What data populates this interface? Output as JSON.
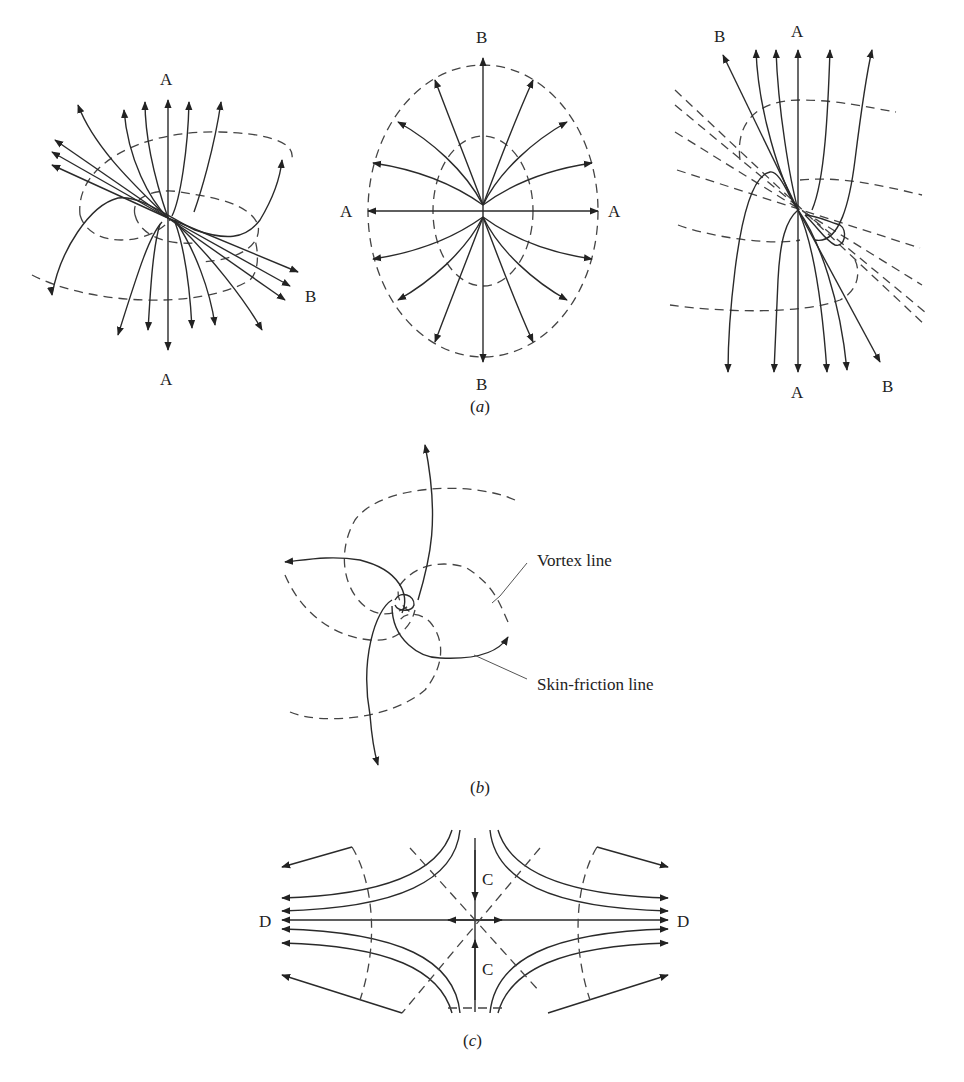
{
  "figure": {
    "panels": [
      {
        "id": "a",
        "caption": "(a)",
        "caption_letter": "a",
        "sub_diagrams": [
          {
            "name": "left",
            "labels": {
              "top": "A",
              "bottom": "A",
              "right": "B"
            }
          },
          {
            "name": "center",
            "labels": {
              "top": "B",
              "bottom": "B",
              "left": "A",
              "right": "A"
            }
          },
          {
            "name": "right",
            "labels": {
              "top_left": "B",
              "top": "A",
              "bottom": "A",
              "bottom_right": "B"
            }
          }
        ]
      },
      {
        "id": "b",
        "caption": "(b)",
        "caption_letter": "b",
        "annotations": {
          "vortex_line": "Vortex line",
          "skin_friction_line": "Skin-friction line"
        }
      },
      {
        "id": "c",
        "caption": "(c)",
        "caption_letter": "c",
        "labels": {
          "top_c": "C",
          "bottom_c": "C",
          "left_d": "D",
          "right_d": "D"
        }
      }
    ],
    "legend": {
      "solid_line": "skin-friction line",
      "dashed_line": "vortex line"
    },
    "colors": {
      "line": "#2a2a2a",
      "dash": "#444444",
      "background": "#ffffff"
    }
  }
}
